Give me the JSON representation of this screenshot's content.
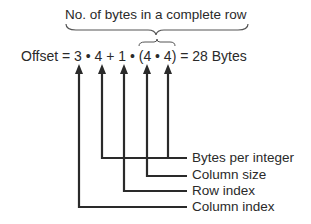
{
  "diagram": {
    "top_label": "No. of bytes in a complete row",
    "equation": "Offset = 3 • 4 + 1 • (4 • 4) = 28 Bytes",
    "labels": [
      {
        "text": "Bytes per integer",
        "y": 150
      },
      {
        "text": "Column size",
        "y": 167
      },
      {
        "text": "Row index",
        "y": 183
      },
      {
        "text": "Column index",
        "y": 199
      }
    ],
    "line_color": "#2a2a2a"
  }
}
